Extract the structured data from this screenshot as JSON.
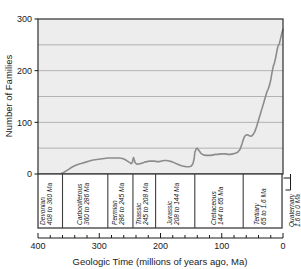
{
  "chart_data": {
    "type": "line",
    "title": "",
    "xlabel": "Geologic Time (millions of years ago, Ma)",
    "ylabel": "Number of Families",
    "xlim": [
      400,
      0
    ],
    "ylim": [
      0,
      300
    ],
    "x_ticks": [
      400,
      300,
      200,
      100,
      0
    ],
    "x_tick_labels": [
      "400",
      "300",
      "200",
      "100",
      "0"
    ],
    "y_ticks": [
      0,
      100,
      200,
      300
    ],
    "y_tick_labels": [
      "0",
      "100",
      "200",
      "300"
    ],
    "y_gridlines": [
      50,
      100,
      150,
      200,
      250
    ],
    "grid": true,
    "x_axis_inverted": true,
    "legend": null,
    "line_color": "#8c8c8c",
    "plot_bg_color": "#ededed",
    "frame_color": "#3d3d3d",
    "grid_color": "#9a9a9a",
    "series": [
      {
        "name": "Number of Families",
        "x": [
          362,
          358,
          354,
          350,
          345,
          340,
          334,
          328,
          322,
          316,
          310,
          304,
          298,
          292,
          286,
          280,
          274,
          268,
          262,
          258,
          254,
          250,
          248,
          246,
          245,
          244,
          243,
          241,
          238,
          234,
          230,
          226,
          222,
          218,
          214,
          210,
          206,
          202,
          198,
          194,
          190,
          186,
          182,
          178,
          174,
          170,
          166,
          162,
          158,
          154,
          150,
          147,
          145,
          144,
          142,
          140,
          137,
          134,
          130,
          126,
          122,
          118,
          114,
          110,
          106,
          102,
          98,
          94,
          90,
          86,
          82,
          78,
          74,
          70,
          67,
          65,
          63,
          61,
          58,
          55,
          52,
          49,
          46,
          43,
          40,
          37,
          34,
          31,
          28,
          26,
          24,
          22,
          20,
          18,
          16,
          14,
          12,
          10,
          8,
          6,
          4,
          2,
          0
        ],
        "y": [
          1,
          3,
          6,
          9,
          13,
          16,
          19,
          21,
          23,
          25,
          27,
          28,
          29,
          30,
          31,
          31,
          31,
          31,
          30,
          28,
          25,
          22,
          20,
          22,
          28,
          32,
          28,
          21,
          19,
          20,
          21,
          23,
          24,
          25,
          25,
          25,
          24,
          24,
          25,
          26,
          26,
          25,
          24,
          22,
          20,
          18,
          16,
          15,
          14,
          14,
          15,
          20,
          30,
          42,
          48,
          50,
          45,
          40,
          37,
          36,
          36,
          36,
          37,
          38,
          38,
          39,
          39,
          39,
          38,
          38,
          39,
          40,
          42,
          48,
          58,
          66,
          72,
          75,
          76,
          74,
          73,
          76,
          82,
          92,
          104,
          116,
          128,
          140,
          152,
          160,
          165,
          172,
          182,
          196,
          208,
          215,
          225,
          238,
          248,
          252,
          262,
          272,
          280
        ]
      }
    ],
    "annotations": {
      "periods": [
        {
          "name": "Devonian",
          "range_label": "408 to 360 Ma",
          "start": 408,
          "end": 360,
          "italic": true
        },
        {
          "name": "Carboniferous",
          "range_label": "360 to 286 Ma",
          "start": 360,
          "end": 286,
          "italic": true
        },
        {
          "name": "Permian",
          "range_label": "286 to 245 Ma",
          "start": 286,
          "end": 245,
          "italic": true
        },
        {
          "name": "Triassic",
          "range_label": "245 to 208 Ma",
          "start": 245,
          "end": 208,
          "italic": true
        },
        {
          "name": "Jurassic",
          "range_label": "208 to 144 Ma",
          "start": 208,
          "end": 144,
          "italic": true
        },
        {
          "name": "Cretaceous",
          "range_label": "144 to 65 Ma",
          "start": 144,
          "end": 65,
          "italic": true
        },
        {
          "name": "Tertiary",
          "range_label": "65 to 1.6 Ma",
          "start": 65,
          "end": 1.6,
          "italic": true
        },
        {
          "name": "Quaternary",
          "range_label": "1.6 to 0 Ma",
          "start": 1.6,
          "end": 0,
          "italic": true,
          "outside": true
        }
      ]
    }
  }
}
